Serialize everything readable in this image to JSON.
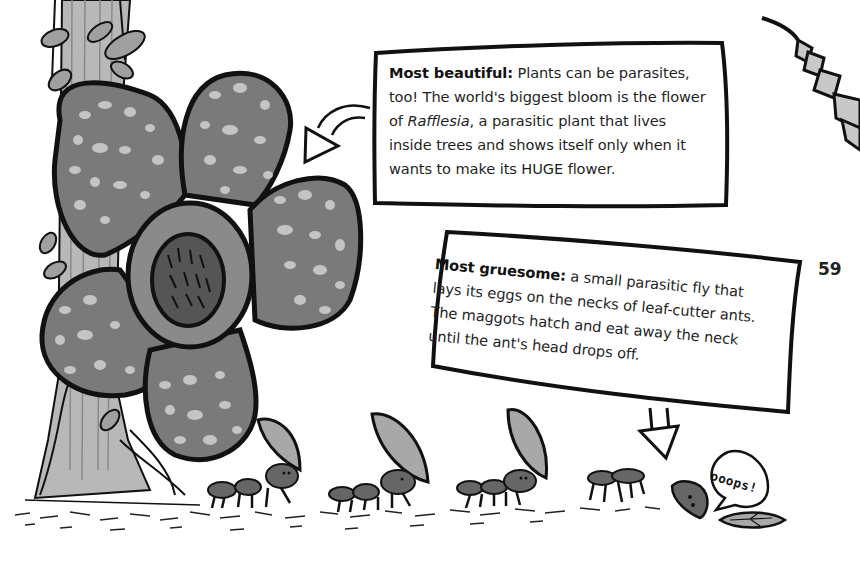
{
  "page": {
    "number": "59"
  },
  "callouts": {
    "beautiful": {
      "heading": "Most beautiful:",
      "lines": [
        " Plants can be parasites,",
        "too! The world's biggest bloom is the flower",
        "of ",
        "Rafflesia",
        ", a parasitic plant that lives",
        "inside trees and shows itself only when it",
        "wants to make its HUGE flower."
      ]
    },
    "gruesome": {
      "heading": "Most gruesome:",
      "lines": [
        " a small parasitic fly that",
        "lays its eggs on the necks of leaf-cutter ants.",
        "The maggots hatch and eat away the neck",
        "until the ant's head drops off."
      ]
    }
  },
  "illustration": {
    "speech_bubble": "ooops!",
    "subjects": [
      "rafflesia-flower",
      "tree-trunk-with-vines",
      "leaf-cutter-ant-1",
      "leaf-cutter-ant-2",
      "leaf-cutter-ant-3",
      "headless-ant",
      "fallen-ant-head",
      "fallen-leaf",
      "parasitic-fly-larva-tail"
    ]
  },
  "colors": {
    "ink": "#111111",
    "petal": "#7a7a7a",
    "spot": "#c4c4c4",
    "center_ring": "#8a8a8a",
    "center_core": "#555555",
    "leaf": "#a8a8a8",
    "ant": "#666666",
    "trunk": "#b5b5b5"
  }
}
